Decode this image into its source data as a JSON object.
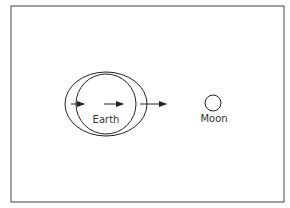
{
  "diagram": {
    "labels": {
      "earth": "Earth",
      "moon": "Moon"
    },
    "colors": {
      "stroke": "#222222",
      "frame": "#444444",
      "background": "#ffffff"
    },
    "arrows": [
      {
        "name": "far-side-arrow",
        "from_x": 71,
        "to_x": 84
      },
      {
        "name": "center-arrow",
        "from_x": 104,
        "to_x": 123
      },
      {
        "name": "near-side-arrow",
        "from_x": 140,
        "to_x": 166
      }
    ]
  }
}
